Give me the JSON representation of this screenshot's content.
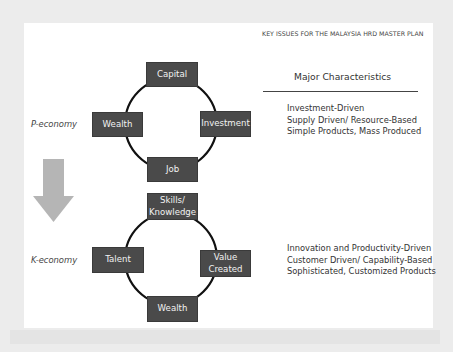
{
  "header": {
    "title": "KEY ISSUES FOR THE MALAYSIA HRD MASTER PLAN"
  },
  "characteristics": {
    "heading": "Major Characteristics",
    "p_economy": [
      "Investment-Driven",
      "Supply Driven/ Resource-Based",
      "Simple Products, Mass Produced"
    ],
    "k_economy": [
      "Innovation and Productivity-Driven",
      "Customer Driven/ Capability-Based",
      "Sophisticated, Customized Products"
    ]
  },
  "p_cycle": {
    "label": "P-economy",
    "nodes": {
      "top": "Capital",
      "right": "Investment",
      "bottom": "Job",
      "left": "Wealth"
    }
  },
  "k_cycle": {
    "label": "K-economy",
    "nodes": {
      "top_line1": "Skills/",
      "top_line2": "Knowledge",
      "right_line1": "Value",
      "right_line2": "Created",
      "bottom": "Wealth",
      "left": "Talent"
    }
  },
  "transition_arrow": {
    "icon": "down-arrow-icon",
    "color": "#b5b5b5"
  },
  "colors": {
    "node_fill": "#4a4a4a",
    "node_text": "#f2f2f2",
    "cycle_line": "#111111",
    "panel_bg": "#ffffff",
    "frame_bg": "#ececec"
  }
}
